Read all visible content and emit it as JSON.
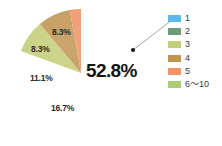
{
  "chart_data": {
    "type": "pie",
    "title": "",
    "categories": [
      "1",
      "2",
      "6〜10",
      "3",
      "4",
      "5"
    ],
    "values": [
      52.8,
      16.7,
      11.1,
      8.3,
      8.3,
      2.8
    ],
    "value_labels": [
      "52.8%",
      "16.7%",
      "11.1%",
      "8.3%",
      "8.3%",
      ""
    ],
    "colors": [
      "#5bb8e8",
      "#6e9b72",
      "#a8ce78",
      "#c4ce78",
      "#c09552",
      "#ee9466"
    ],
    "units": "percent",
    "legend_position": "right",
    "grid": false,
    "start_angle_deg": 0,
    "direction": "clockwise",
    "annotations": [
      {
        "name": "callout-leader",
        "from_label": "1",
        "description": "dot inside largest slice connected by leader line to legend entry 1"
      }
    ]
  },
  "legend": {
    "items": [
      {
        "label": "1",
        "color": "#5bb8e8"
      },
      {
        "label": "2",
        "color": "#6e9b72"
      },
      {
        "label": "3",
        "color": "#c4ce78"
      },
      {
        "label": "4",
        "color": "#c09552"
      },
      {
        "label": "5",
        "color": "#ee9466"
      },
      {
        "label": "6〜10",
        "color": "#a8ce78"
      }
    ]
  },
  "slice_labels": {
    "major": "52.8%",
    "second": "16.7%",
    "third": "11.1%",
    "fourth": "8.3%",
    "fifth": "8.3%"
  },
  "colors": {
    "slice_1": "#5bb8e8",
    "slice_2": "#6e9b72",
    "slice_3": "#c4ce78",
    "slice_4": "#c09552",
    "slice_5": "#ee9466",
    "slice_6_10": "#a8ce78",
    "leader_line": "#7a7a7a",
    "dot": "#111111",
    "background": "#ffffff"
  }
}
